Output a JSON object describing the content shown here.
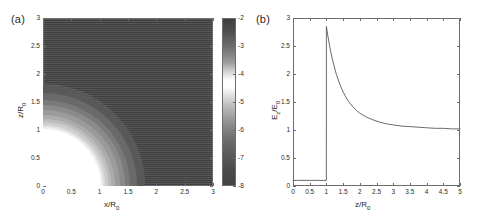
{
  "figure": {
    "width": 490,
    "height": 220,
    "background": "#ffffff"
  },
  "panel_a": {
    "label": "(a)",
    "chart_data": {
      "type": "heatmap",
      "title": "",
      "xlabel": "x/R",
      "xlabel_sub": "0",
      "ylabel": "z/R",
      "ylabel_sub": "0",
      "xlim": [
        0,
        3
      ],
      "ylim": [
        0,
        3
      ],
      "xticks": [
        0,
        0.5,
        1,
        1.5,
        2,
        2.5,
        3
      ],
      "xticklabels": [
        "0",
        "0.5",
        "1",
        "1.5",
        "2",
        "2.5",
        "3"
      ],
      "yticks": [
        0,
        0.5,
        1,
        1.5,
        2,
        2.5,
        3
      ],
      "yticklabels": [
        "0",
        "0.5",
        "1",
        "1.5",
        "2",
        "2.5",
        "3"
      ],
      "grid": false,
      "colormap": "gray",
      "colorbar": {
        "ticks": [
          -2,
          -3,
          -4,
          -5,
          -6,
          -7,
          -8
        ],
        "ticklabels": [
          "-2",
          "-3",
          "-4",
          "-5",
          "-6",
          "-7",
          "-8"
        ],
        "vmin": -8,
        "vmax": -2,
        "orientation": "vertical"
      },
      "description": "Log-scaled field magnitude around a spherical particle of unit radius centred at the origin. Interior r<1 masked white; dense concentric contour arcs just outside r=1; mid-grey lobe bounded by an arc near r=1.8; uniform dark far field.",
      "features": {
        "masked_core_radius": 1.0,
        "lobe_arc_radius": 1.8,
        "contour_rings": [
          1.02,
          1.05,
          1.09,
          1.14,
          1.2,
          1.27,
          1.35,
          1.44,
          1.54,
          1.66,
          1.8
        ],
        "core_color": "#ffffff",
        "lobe_color": "#595959",
        "far_field_color": "#3f3f3f"
      }
    }
  },
  "panel_b": {
    "label": "(b)",
    "chart_data": {
      "type": "line",
      "title": "",
      "xlabel": "z/R",
      "xlabel_sub": "0",
      "ylabel": "E",
      "ylabel_sub": "z",
      "ylabel_tail": "/E",
      "ylabel_tail_sub": "0",
      "xlim": [
        0,
        5
      ],
      "ylim": [
        0,
        3
      ],
      "xticks": [
        0,
        0.5,
        1,
        1.5,
        2,
        2.5,
        3,
        3.5,
        4,
        4.5,
        5
      ],
      "xticklabels": [
        "0",
        "0.5",
        "1",
        "1.5",
        "2",
        "2.5",
        "3",
        "3.5",
        "4",
        "4.5",
        "5"
      ],
      "yticks": [
        0,
        0.5,
        1,
        1.5,
        2,
        2.5,
        3
      ],
      "yticklabels": [
        "0",
        "0.5",
        "1",
        "1.5",
        "2",
        "2.5",
        "3"
      ],
      "grid": false,
      "legend": null,
      "line_color": "#5a5a5a",
      "series": [
        {
          "name": "Ez/E0",
          "x": [
            0,
            0.1,
            0.2,
            0.3,
            0.4,
            0.5,
            0.6,
            0.7,
            0.8,
            0.9,
            0.999,
            1.0,
            1.02,
            1.05,
            1.1,
            1.15,
            1.2,
            1.3,
            1.4,
            1.5,
            1.6,
            1.7,
            1.8,
            1.9,
            2.0,
            2.2,
            2.4,
            2.6,
            2.8,
            3.0,
            3.25,
            3.5,
            3.75,
            4.0,
            4.25,
            4.5,
            4.75,
            5.0
          ],
          "y": [
            0.1,
            0.1,
            0.1,
            0.1,
            0.1,
            0.1,
            0.1,
            0.1,
            0.1,
            0.1,
            0.1,
            2.85,
            2.77,
            2.66,
            2.49,
            2.34,
            2.21,
            1.99,
            1.82,
            1.68,
            1.57,
            1.48,
            1.41,
            1.35,
            1.3,
            1.23,
            1.18,
            1.14,
            1.11,
            1.09,
            1.07,
            1.06,
            1.05,
            1.04,
            1.03,
            1.03,
            1.02,
            1.02
          ]
        }
      ],
      "annotations": {
        "plateau_value": 0.1,
        "peak_value": 2.85,
        "peak_x": 1.0,
        "asymptote": 1.0
      }
    }
  }
}
